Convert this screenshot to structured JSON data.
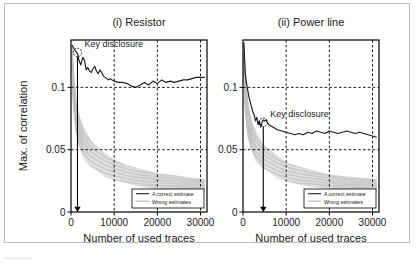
{
  "figure": {
    "panel_count": 2,
    "border_color": "#b9b9b9",
    "background": "#ffffff",
    "caption_partial": "————"
  },
  "common": {
    "xlabel": "Number of used traces",
    "ylabel": "Max. of correlation",
    "xticks": [
      0,
      10000,
      20000,
      30000
    ],
    "xtick_labels": [
      "0",
      "10000",
      "20000",
      "30000"
    ],
    "yticks": [
      0,
      0.05,
      0.1
    ],
    "ytick_labels": [
      "0",
      "0.05",
      "0.1"
    ],
    "xlim": [
      0,
      31500
    ],
    "ylim": [
      0,
      0.138
    ],
    "grid": "dashed-vertical-and-horizontal",
    "annotation_label": "Key disclosure",
    "series_colors": {
      "correct": "#1a1a1a",
      "wrong": "#c4c4c4"
    },
    "legend": {
      "items": [
        "A correct estimate",
        "Wrong estimates"
      ],
      "position": "lower-right"
    }
  },
  "chart_data": [
    {
      "type": "line",
      "panel_id": "resistor",
      "title": "(i) Resistor",
      "xlabel": "Number of used traces",
      "ylabel": "Max. of correlation",
      "xlim": [
        0,
        31500
      ],
      "ylim": [
        0,
        0.138
      ],
      "xticks": [
        0,
        10000,
        20000,
        30000
      ],
      "yticks": [
        0,
        0.05,
        0.1
      ],
      "grid": true,
      "legend": [
        "A correct estimate",
        "Wrong estimates"
      ],
      "annotations": [
        {
          "text": "Key disclosure",
          "x": 1500,
          "y": 0.128,
          "marker": "circle",
          "arrow_to_y": 0
        }
      ],
      "series": [
        {
          "name": "A correct estimate",
          "color": "#1a1a1a",
          "x": [
            300,
            700,
            1100,
            1500,
            1900,
            2300,
            2700,
            3100,
            3500,
            3900,
            4300,
            4700,
            5100,
            5500,
            5900,
            6300,
            6700,
            7100,
            7500,
            7900,
            8300,
            8700,
            9100,
            9500,
            10000,
            11000,
            12000,
            13000,
            14000,
            15000,
            16000,
            17000,
            18000,
            19000,
            20000,
            21000,
            22000,
            23000,
            24000,
            25000,
            26000,
            27000,
            28000,
            29000,
            30000,
            31000
          ],
          "y": [
            0.134,
            0.131,
            0.129,
            0.127,
            0.121,
            0.118,
            0.124,
            0.122,
            0.114,
            0.116,
            0.113,
            0.112,
            0.115,
            0.117,
            0.113,
            0.111,
            0.114,
            0.112,
            0.109,
            0.108,
            0.107,
            0.106,
            0.107,
            0.106,
            0.105,
            0.104,
            0.104,
            0.103,
            0.101,
            0.1,
            0.102,
            0.104,
            0.102,
            0.105,
            0.103,
            0.106,
            0.104,
            0.105,
            0.104,
            0.105,
            0.106,
            0.106,
            0.107,
            0.108,
            0.108,
            0.108
          ]
        },
        {
          "name": "Wrong estimates",
          "color": "#c4c4c4",
          "band_upper_x": [
            200,
            600,
            1200,
            2000,
            3000,
            4500,
            6000,
            8000,
            10000,
            13000,
            16000,
            20000,
            24000,
            28000,
            31000
          ],
          "band_upper_y": [
            0.134,
            0.11,
            0.088,
            0.075,
            0.066,
            0.058,
            0.052,
            0.046,
            0.042,
            0.037,
            0.034,
            0.031,
            0.029,
            0.027,
            0.026
          ],
          "band_lower_x": [
            200,
            600,
            1200,
            2000,
            3000,
            4500,
            6000,
            8000,
            10000,
            13000,
            16000,
            20000,
            24000,
            28000,
            31000
          ],
          "band_lower_y": [
            0.12,
            0.082,
            0.064,
            0.052,
            0.044,
            0.037,
            0.033,
            0.029,
            0.026,
            0.023,
            0.021,
            0.019,
            0.018,
            0.017,
            0.016
          ]
        }
      ]
    },
    {
      "type": "line",
      "panel_id": "power-line",
      "title": "(ii) Power line",
      "xlabel": "Number of used traces",
      "ylabel": "Max. of correlation",
      "xlim": [
        0,
        31500
      ],
      "ylim": [
        0,
        0.138
      ],
      "xticks": [
        0,
        10000,
        20000,
        30000
      ],
      "yticks": [
        0,
        0.05,
        0.1
      ],
      "grid": true,
      "legend": [
        "A correct estimate",
        "Wrong estimates"
      ],
      "annotations": [
        {
          "text": "Key disclosure",
          "x": 4700,
          "y": 0.072,
          "marker": "circle",
          "arrow_to_y": 0
        }
      ],
      "series": [
        {
          "name": "A correct estimate",
          "color": "#1a1a1a",
          "x": [
            200,
            500,
            800,
            1100,
            1400,
            1700,
            2000,
            2300,
            2600,
            2900,
            3200,
            3500,
            3800,
            4100,
            4400,
            4700,
            5000,
            5300,
            5600,
            6000,
            6500,
            7000,
            7500,
            8000,
            9000,
            10000,
            11000,
            12000,
            13000,
            14000,
            15000,
            16000,
            17000,
            18000,
            19000,
            20000,
            21000,
            22000,
            23000,
            24000,
            25000,
            26000,
            27000,
            28000,
            29000,
            30000,
            31000
          ],
          "y": [
            0.136,
            0.112,
            0.103,
            0.098,
            0.092,
            0.088,
            0.084,
            0.08,
            0.078,
            0.073,
            0.076,
            0.07,
            0.073,
            0.068,
            0.072,
            0.074,
            0.073,
            0.074,
            0.072,
            0.07,
            0.069,
            0.068,
            0.067,
            0.066,
            0.065,
            0.064,
            0.063,
            0.062,
            0.063,
            0.062,
            0.064,
            0.063,
            0.065,
            0.064,
            0.063,
            0.065,
            0.064,
            0.063,
            0.064,
            0.065,
            0.064,
            0.063,
            0.064,
            0.063,
            0.062,
            0.061,
            0.06
          ]
        },
        {
          "name": "Wrong estimates",
          "color": "#c4c4c4",
          "band_upper_x": [
            200,
            600,
            1200,
            2000,
            3000,
            4500,
            6000,
            8000,
            10000,
            13000,
            16000,
            20000,
            24000,
            28000,
            31000
          ],
          "band_upper_y": [
            0.128,
            0.105,
            0.085,
            0.072,
            0.063,
            0.055,
            0.05,
            0.044,
            0.04,
            0.036,
            0.033,
            0.03,
            0.028,
            0.027,
            0.026
          ],
          "band_lower_x": [
            200,
            600,
            1200,
            2000,
            3000,
            4500,
            6000,
            8000,
            10000,
            13000,
            16000,
            20000,
            24000,
            28000,
            31000
          ],
          "band_lower_y": [
            0.112,
            0.078,
            0.06,
            0.049,
            0.042,
            0.036,
            0.032,
            0.028,
            0.025,
            0.022,
            0.021,
            0.019,
            0.018,
            0.017,
            0.016
          ]
        }
      ]
    }
  ]
}
